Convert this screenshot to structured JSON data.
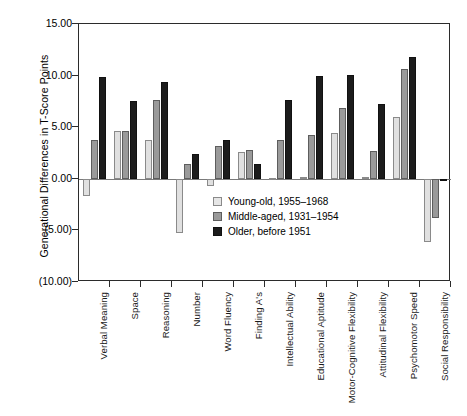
{
  "chart_data": {
    "type": "bar",
    "title": "",
    "xlabel": "",
    "ylabel": "Generational Differences in T-Score Points",
    "ylim": [
      -10,
      15
    ],
    "yticks": [
      15,
      10,
      5,
      0,
      -5,
      -10
    ],
    "ytick_labels": [
      "15.00",
      "10.00",
      "5.00",
      "0.00",
      "(5.00)",
      "(10.00)"
    ],
    "grid": false,
    "legend_position": "inside-center",
    "categories": [
      "Verbal Meaning",
      "Space",
      "Reasoning",
      "Number",
      "Word Fluency",
      "Finding A's",
      "Intellectual Ability",
      "Educational Aptitude",
      "Motor-Cognitive Flexibility",
      "Attitudinal Flexibility",
      "Psychomotor Speed",
      "Social Responsibility"
    ],
    "series": [
      {
        "name": "Young-old, 1955–1968",
        "color": "#e0e0e0",
        "values": [
          -1.7,
          4.6,
          3.8,
          -5.3,
          -0.7,
          2.6,
          0.1,
          0.2,
          4.4,
          0.2,
          6.0,
          -6.1
        ]
      },
      {
        "name": "Middle-aged, 1931–1954",
        "color": "#9a9a9a",
        "values": [
          3.8,
          4.6,
          7.6,
          1.4,
          3.2,
          2.8,
          3.8,
          4.2,
          6.9,
          2.7,
          10.6,
          -3.8
        ]
      },
      {
        "name": "Older, before 1951",
        "color": "#1c1c1c",
        "values": [
          9.9,
          7.5,
          9.4,
          2.4,
          3.8,
          1.4,
          7.6,
          10.0,
          10.1,
          7.2,
          11.8,
          -0.1
        ]
      }
    ]
  },
  "legend": {
    "items": [
      {
        "label": "Young-old, 1955–1968",
        "swatch": "light-gray-swatch"
      },
      {
        "label": "Middle-aged, 1931–1954",
        "swatch": "medium-gray-swatch"
      },
      {
        "label": "Older, before 1951",
        "swatch": "black-swatch"
      }
    ]
  }
}
